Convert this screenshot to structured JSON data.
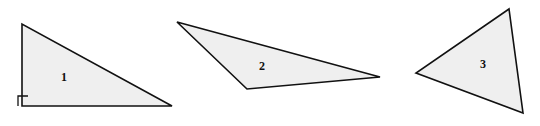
{
  "figure": {
    "width": 540,
    "height": 126,
    "background_color": "#ffffff",
    "fill_color": "#efefef",
    "stroke_color": "#111111",
    "stroke_width": 1.6
  },
  "shapes": [
    {
      "label": "1",
      "name": "triangle-1",
      "kind": "right-triangle",
      "points": "22,24 22,106 172,106",
      "label_x": 64,
      "label_y": 78,
      "right_angle_marker": "18,106 18,96 28,96",
      "has_right_angle_marker": true
    },
    {
      "label": "2",
      "name": "triangle-2",
      "kind": "obtuse-scalene-triangle",
      "points": "177,22 247,89 380,77",
      "label_x": 262,
      "label_y": 67,
      "right_angle_marker": "",
      "has_right_angle_marker": false
    },
    {
      "label": "3",
      "name": "triangle-3",
      "kind": "acute-scalene-triangle",
      "points": "509,9 416,73 523,113",
      "label_x": 483,
      "label_y": 65,
      "right_angle_marker": "",
      "has_right_angle_marker": false
    }
  ]
}
